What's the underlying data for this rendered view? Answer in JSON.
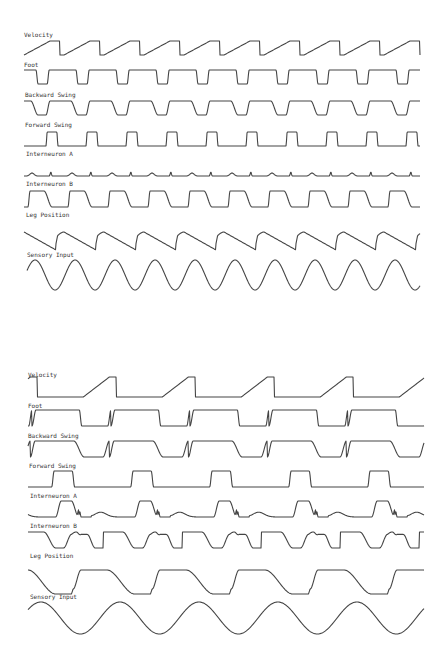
{
  "chart_data": [
    {
      "type": "line",
      "title": "",
      "panel": "top (fast gait)",
      "x_range_px": [
        24,
        420
      ],
      "period_px": 40,
      "cycles": 9.5,
      "series": [
        {
          "name": "Velocity",
          "shape": "sawtooth-ramp",
          "baseline_y": 55,
          "label_y": 36
        },
        {
          "name": "Foot",
          "shape": "square-high-with-short-dips",
          "baseline_y": 84,
          "label_y": 66
        },
        {
          "name": "Backward Swing",
          "shape": "rounded-square",
          "baseline_y": 115,
          "label_y": 96
        },
        {
          "name": "Forward Swing",
          "shape": "short-pulses",
          "baseline_y": 146,
          "label_y": 126
        },
        {
          "name": "Interneuron A",
          "shape": "small-bumps-and-spikes",
          "baseline_y": 176,
          "label_y": 155
        },
        {
          "name": "Interneuron B",
          "shape": "rounded-square",
          "baseline_y": 207,
          "label_y": 184
        },
        {
          "name": "Leg Position",
          "shape": "descending-sawtooth",
          "baseline_y": 250,
          "label_y": 215
        },
        {
          "name": "Sensory Input",
          "shape": "sine",
          "baseline_y": 290,
          "label_y": 255
        }
      ]
    },
    {
      "type": "line",
      "title": "",
      "panel": "bottom (slow gait)",
      "x_range_px": [
        28,
        424
      ],
      "period_px": 79,
      "cycles": 5,
      "series": [
        {
          "name": "Velocity",
          "shape": "sawtooth-ramp",
          "baseline_y": 397,
          "label_y": 375
        },
        {
          "name": "Foot",
          "shape": "square-high-with-dips",
          "baseline_y": 426,
          "label_y": 406
        },
        {
          "name": "Backward Swing",
          "shape": "rounded-square",
          "baseline_y": 457,
          "label_y": 436
        },
        {
          "name": "Forward Swing",
          "shape": "pulses",
          "baseline_y": 487,
          "label_y": 466
        },
        {
          "name": "Interneuron A",
          "shape": "plateau-with-wiggle",
          "baseline_y": 517,
          "label_y": 496
        },
        {
          "name": "Interneuron B",
          "shape": "bumpy-plateau",
          "baseline_y": 548,
          "label_y": 526
        },
        {
          "name": "Leg Position",
          "shape": "stepped-wave",
          "baseline_y": 594,
          "label_y": 556
        },
        {
          "name": "Sensory Input",
          "shape": "sine",
          "baseline_y": 635,
          "label_y": 597
        }
      ]
    }
  ],
  "labels": {
    "velocity": "Velocity",
    "foot": "Foot",
    "backward": "Backward Swing",
    "forward": "Forward Swing",
    "intA": "Interneuron A",
    "intB": "Interneuron B",
    "legpos": "Leg Position",
    "sensory": "Sensory Input"
  },
  "colors": {
    "trace": "#444444",
    "text": "#333333",
    "background": "#ffffff"
  }
}
